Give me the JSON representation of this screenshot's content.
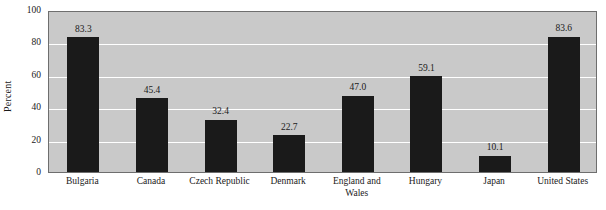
{
  "chart_data": {
    "type": "bar",
    "title": "",
    "xlabel": "",
    "ylabel": "Percent",
    "ylim": [
      0,
      100
    ],
    "yticks": [
      0,
      20,
      40,
      60,
      80,
      100
    ],
    "ytick_labels": [
      "0",
      "20",
      "40",
      "60",
      "80",
      "100"
    ],
    "grid": "horizontal",
    "legend": "none",
    "categories": [
      "Bulgaria",
      "Canada",
      "Czech Republic",
      "Denmark",
      "England and Wales",
      "Hungary",
      "Japan",
      "United States"
    ],
    "values": [
      83.3,
      45.4,
      32.4,
      22.7,
      47.0,
      59.1,
      10.1,
      83.6
    ],
    "value_labels": [
      "83.3",
      "45.4",
      "32.4",
      "22.7",
      "47.0",
      "59.1",
      "10.1",
      "83.6"
    ],
    "colors": {
      "bar": "#1a1a1a",
      "plot_background": "#c9c9c9",
      "gridline": "#ffffff",
      "axis_text": "#1a1a1a",
      "plot_border": "#6e6e6e",
      "page_background": "#ffffff"
    }
  }
}
